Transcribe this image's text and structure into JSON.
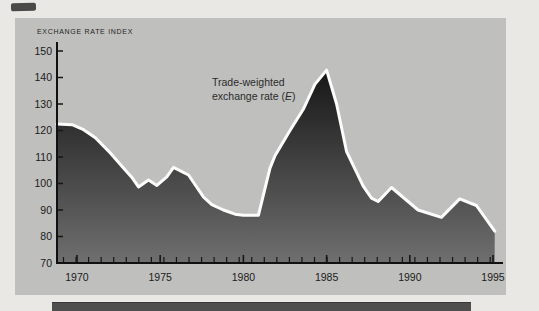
{
  "page": {
    "background": "#e9e8e4"
  },
  "chart_data": {
    "type": "area",
    "title": "EXCHANGE RATE INDEX",
    "annotation": {
      "line1": "Trade-weighted",
      "line2_pre": "exchange rate (",
      "line2_italic": "E",
      "line2_post": ")"
    },
    "x_ticks": [
      {
        "year": 1970,
        "label": "1970"
      },
      {
        "year": 1975,
        "label": "1975"
      },
      {
        "year": 1980,
        "label": "1980"
      },
      {
        "year": 1985,
        "label": "1985"
      },
      {
        "year": 1990,
        "label": "1990"
      },
      {
        "year": 1995,
        "label": "1995"
      }
    ],
    "y_ticks": [
      {
        "value": 150,
        "label": "150"
      },
      {
        "value": 140,
        "label": "140"
      },
      {
        "value": 130,
        "label": "130"
      },
      {
        "value": 120,
        "label": "120"
      },
      {
        "value": 110,
        "label": "110"
      },
      {
        "value": 100,
        "label": "100"
      },
      {
        "value": 90,
        "label": "90"
      },
      {
        "value": 80,
        "label": "80"
      },
      {
        "value": 70,
        "label": "70"
      }
    ],
    "xlim": [
      1968.8,
      1995.6
    ],
    "ylim": [
      70,
      150
    ],
    "grid": false,
    "legend_position": "inline-annotation",
    "series": [
      {
        "name": "Trade-weighted exchange rate (E)",
        "points": [
          [
            1968.8,
            122.4
          ],
          [
            1969.7,
            122.2
          ],
          [
            1970.4,
            120.3
          ],
          [
            1971.1,
            117.3
          ],
          [
            1972.0,
            111.5
          ],
          [
            1972.7,
            106.5
          ],
          [
            1973.3,
            102.3
          ],
          [
            1973.7,
            98.7
          ],
          [
            1974.3,
            101.3
          ],
          [
            1974.8,
            99.3
          ],
          [
            1975.4,
            102.5
          ],
          [
            1975.8,
            106.1
          ],
          [
            1976.7,
            103.2
          ],
          [
            1977.6,
            95.0
          ],
          [
            1978.1,
            92.0
          ],
          [
            1978.8,
            90.0
          ],
          [
            1979.5,
            88.4
          ],
          [
            1980.0,
            88.0
          ],
          [
            1980.9,
            88.0
          ],
          [
            1981.6,
            105.8
          ],
          [
            1981.9,
            110.5
          ],
          [
            1982.8,
            120.0
          ],
          [
            1983.6,
            128.0
          ],
          [
            1984.3,
            137.4
          ],
          [
            1985.0,
            142.8
          ],
          [
            1985.6,
            130.0
          ],
          [
            1986.2,
            112.0
          ],
          [
            1987.2,
            99.0
          ],
          [
            1987.7,
            94.5
          ],
          [
            1988.1,
            93.2
          ],
          [
            1988.9,
            98.5
          ],
          [
            1990.5,
            90.0
          ],
          [
            1991.9,
            87.2
          ],
          [
            1993.0,
            94.2
          ],
          [
            1994.0,
            91.7
          ],
          [
            1995.1,
            82.0
          ]
        ]
      }
    ]
  },
  "colors": {
    "panel": "#bfbfbd",
    "area_top": "#131313",
    "area_bottom": "#6f6f6f",
    "line": "#fdfdfd",
    "axis": "#111111",
    "tick": "#161616",
    "text": "#1b1b1b",
    "caption_bar": "#4e4e4e",
    "ink_mark": "#3b3b3b"
  }
}
